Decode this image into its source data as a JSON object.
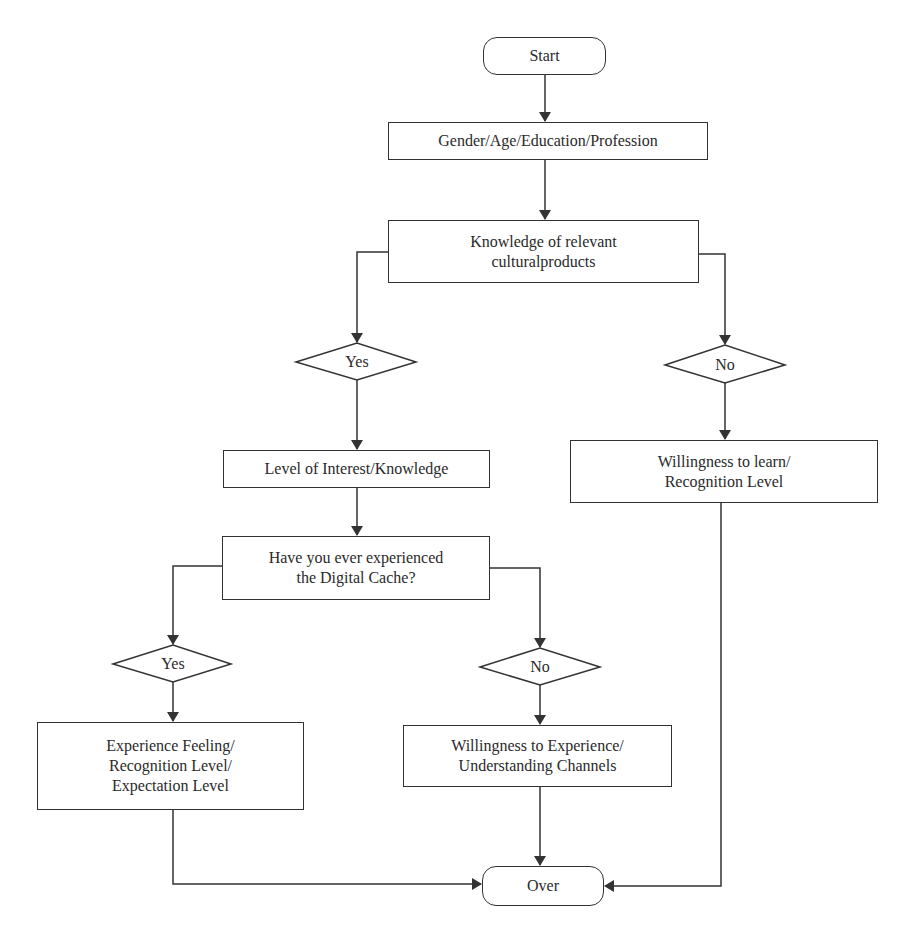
{
  "diagram": {
    "type": "flowchart",
    "nodes": {
      "start": {
        "label": "Start"
      },
      "demographics": {
        "label": "Gender/Age/Education/Profession"
      },
      "knowledge": {
        "label": "Knowledge of relevant\nculturalproducts"
      },
      "yes1": {
        "label": "Yes"
      },
      "no1": {
        "label": "No"
      },
      "interest": {
        "label": "Level of Interest/Knowledge"
      },
      "willing_learn": {
        "label": "Willingness to learn/\nRecognition Level"
      },
      "experienced": {
        "label": "Have you ever experienced\nthe Digital Cache?"
      },
      "yes2": {
        "label": "Yes"
      },
      "no2": {
        "label": "No"
      },
      "experience_feeling": {
        "label": "Experience Feeling/\nRecognition Level/\nExpectation Level"
      },
      "willing_experience": {
        "label": "Willingness to Experience/\nUnderstanding Channels"
      },
      "over": {
        "label": "Over"
      }
    },
    "edges": [
      [
        "start",
        "demographics"
      ],
      [
        "demographics",
        "knowledge"
      ],
      [
        "knowledge",
        "yes1"
      ],
      [
        "knowledge",
        "no1"
      ],
      [
        "yes1",
        "interest"
      ],
      [
        "no1",
        "willing_learn"
      ],
      [
        "interest",
        "experienced"
      ],
      [
        "experienced",
        "yes2"
      ],
      [
        "experienced",
        "no2"
      ],
      [
        "yes2",
        "experience_feeling"
      ],
      [
        "no2",
        "willing_experience"
      ],
      [
        "experience_feeling",
        "over"
      ],
      [
        "willing_experience",
        "over"
      ],
      [
        "willing_learn",
        "over"
      ]
    ],
    "colors": {
      "stroke": "#333333",
      "fill": "#ffffff",
      "text": "#2a2a2a"
    }
  }
}
